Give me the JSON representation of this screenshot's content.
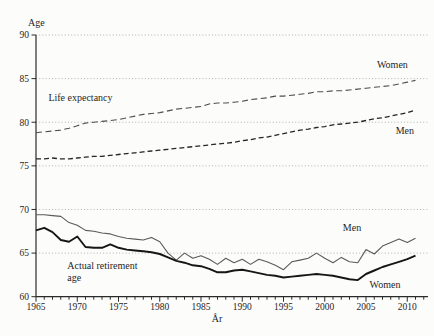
{
  "chart_data": {
    "type": "line",
    "title": "",
    "xlabel": "År",
    "ylabel": "Age",
    "xlim": [
      1965,
      2012
    ],
    "ylim": [
      60,
      90
    ],
    "yticks": [
      60,
      65,
      70,
      75,
      80,
      85,
      90
    ],
    "xticks": [
      1965,
      1970,
      1975,
      1980,
      1985,
      1990,
      1995,
      2000,
      2005,
      2010
    ],
    "grid": "dotted-horizontal",
    "legend_position": "inline-annotations",
    "colors": {
      "grid": "#b2b2b2",
      "axis": "#2a2a2a",
      "text": "#1f1f1f"
    },
    "x": [
      1965,
      1966,
      1967,
      1968,
      1969,
      1970,
      1971,
      1972,
      1973,
      1974,
      1975,
      1976,
      1977,
      1978,
      1979,
      1980,
      1981,
      1982,
      1983,
      1984,
      1985,
      1986,
      1987,
      1988,
      1989,
      1990,
      1991,
      1992,
      1993,
      1994,
      1995,
      1996,
      1997,
      1998,
      1999,
      2000,
      2001,
      2002,
      2003,
      2004,
      2005,
      2006,
      2007,
      2008,
      2009,
      2010,
      2011
    ],
    "series": [
      {
        "name": "Life expectancy Women",
        "style": "dashed",
        "color": "#4d4d4d",
        "width": 1.1,
        "dash": [
          6,
          3.5
        ],
        "values": [
          78.8,
          78.9,
          79.0,
          79.1,
          79.3,
          79.6,
          79.9,
          80.0,
          80.1,
          80.2,
          80.3,
          80.5,
          80.7,
          80.9,
          81.0,
          81.1,
          81.3,
          81.5,
          81.6,
          81.7,
          81.8,
          82.1,
          82.2,
          82.2,
          82.3,
          82.4,
          82.6,
          82.7,
          82.8,
          83.0,
          83.0,
          83.1,
          83.2,
          83.3,
          83.5,
          83.5,
          83.6,
          83.6,
          83.7,
          83.8,
          83.9,
          84.0,
          84.1,
          84.2,
          84.4,
          84.6,
          84.8
        ]
      },
      {
        "name": "Life expectancy Men",
        "style": "dashed",
        "color": "#262626",
        "width": 1.3,
        "dash": [
          5,
          3
        ],
        "values": [
          75.8,
          75.8,
          75.9,
          75.8,
          75.8,
          75.9,
          76.0,
          76.1,
          76.1,
          76.2,
          76.3,
          76.4,
          76.5,
          76.6,
          76.7,
          76.8,
          76.9,
          77.0,
          77.1,
          77.2,
          77.3,
          77.4,
          77.5,
          77.6,
          77.7,
          77.9,
          78.0,
          78.2,
          78.3,
          78.5,
          78.7,
          78.9,
          79.1,
          79.2,
          79.4,
          79.5,
          79.7,
          79.8,
          79.9,
          80.0,
          80.2,
          80.4,
          80.5,
          80.7,
          80.9,
          81.1,
          81.4
        ]
      },
      {
        "name": "Actual retirement age Men",
        "style": "solid",
        "color": "#5a5a5a",
        "width": 1.1,
        "dash": null,
        "values": [
          69.4,
          69.4,
          69.3,
          69.2,
          68.5,
          68.2,
          67.6,
          67.5,
          67.3,
          67.2,
          66.9,
          66.7,
          66.6,
          66.5,
          66.8,
          66.3,
          65.0,
          64.2,
          65.0,
          64.4,
          64.7,
          64.3,
          63.7,
          64.4,
          63.9,
          64.3,
          63.7,
          64.3,
          64.0,
          63.6,
          63.1,
          64.0,
          64.2,
          64.4,
          65.0,
          64.4,
          63.9,
          64.5,
          64.0,
          63.9,
          65.4,
          64.9,
          65.8,
          66.2,
          66.6,
          66.2,
          66.7
        ]
      },
      {
        "name": "Actual retirement age Women",
        "style": "solid",
        "color": "#161616",
        "width": 1.9,
        "dash": null,
        "values": [
          67.6,
          67.9,
          67.4,
          66.5,
          66.3,
          66.9,
          65.7,
          65.6,
          65.6,
          66.0,
          65.6,
          65.4,
          65.3,
          65.2,
          65.1,
          64.9,
          64.5,
          64.1,
          63.9,
          63.6,
          63.5,
          63.2,
          62.8,
          62.8,
          63.0,
          63.1,
          62.9,
          62.7,
          62.5,
          62.4,
          62.2,
          62.3,
          62.4,
          62.5,
          62.6,
          62.5,
          62.4,
          62.2,
          62.0,
          61.9,
          62.6,
          63.0,
          63.4,
          63.7,
          64.0,
          64.3,
          64.7
        ]
      }
    ],
    "annotations": [
      {
        "text": "Life expectancy",
        "year": 1966.5,
        "age": 82.4,
        "anchor": "start"
      },
      {
        "text": "Actual retirement",
        "year": 1968.8,
        "age": 63.2,
        "anchor": "start"
      },
      {
        "text": "age",
        "year": 1968.8,
        "age": 61.8,
        "anchor": "start"
      },
      {
        "text": "Women",
        "year": 2008.2,
        "age": 86.2,
        "anchor": "middle"
      },
      {
        "text": "Men",
        "year": 2009.7,
        "age": 78.6,
        "anchor": "middle"
      },
      {
        "text": "Men",
        "year": 2003.3,
        "age": 67.5,
        "anchor": "middle"
      },
      {
        "text": "Women",
        "year": 2007.3,
        "age": 61.0,
        "anchor": "middle"
      }
    ]
  }
}
